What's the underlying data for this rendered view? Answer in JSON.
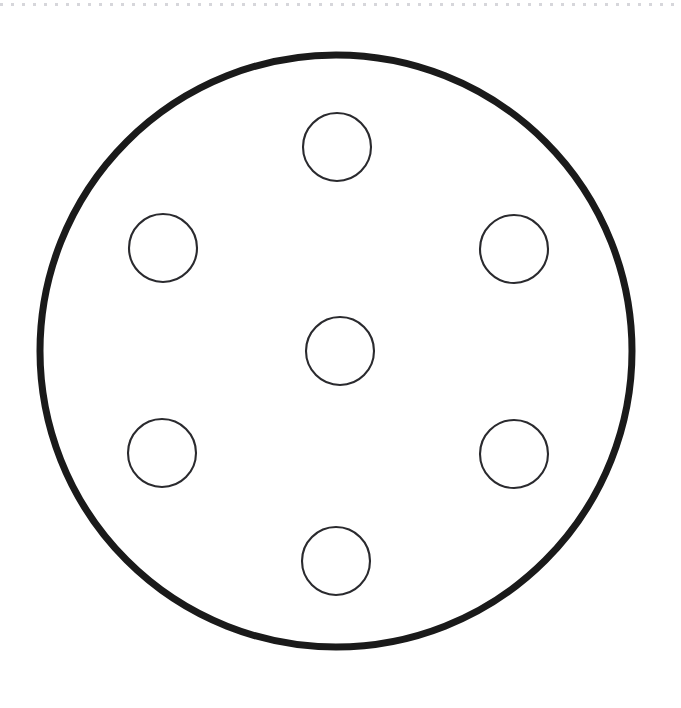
{
  "page": {
    "background_color": "#ffffff",
    "width": 681,
    "height": 708
  },
  "artifacts": {
    "top_dotted_rule": {
      "name": "scan-edge-dotted-line",
      "color": "#c9c9cf",
      "y": 3,
      "dash_on": 3,
      "dash_off": 8
    }
  },
  "drawing": {
    "type": "engineering-line-drawing",
    "stroke_color_outer": "#1a1a1a",
    "stroke_color_holes": "#2a2a2e",
    "fill_color": "#ffffff",
    "outer_circle": {
      "name": "outer-disc-outline",
      "cx": 336,
      "cy": 351,
      "r": 296,
      "stroke_width": 7
    },
    "center_hole": {
      "name": "center-hole",
      "cx": 340,
      "cy": 351,
      "r": 34,
      "stroke_width": 2.1
    },
    "bolt_holes": [
      {
        "name": "bolt-hole-top",
        "cx": 337,
        "cy": 147,
        "r": 34,
        "stroke_width": 2.1
      },
      {
        "name": "bolt-hole-upper-right",
        "cx": 514,
        "cy": 249,
        "r": 34,
        "stroke_width": 2.1
      },
      {
        "name": "bolt-hole-lower-right",
        "cx": 514,
        "cy": 454,
        "r": 34,
        "stroke_width": 2.1
      },
      {
        "name": "bolt-hole-bottom",
        "cx": 336,
        "cy": 561,
        "r": 34,
        "stroke_width": 2.1
      },
      {
        "name": "bolt-hole-lower-left",
        "cx": 162,
        "cy": 453,
        "r": 34,
        "stroke_width": 2.1
      },
      {
        "name": "bolt-hole-upper-left",
        "cx": 163,
        "cy": 248,
        "r": 34,
        "stroke_width": 2.1
      }
    ],
    "hole_count_total": 7,
    "bolt_hole_count": 6,
    "labels": []
  }
}
